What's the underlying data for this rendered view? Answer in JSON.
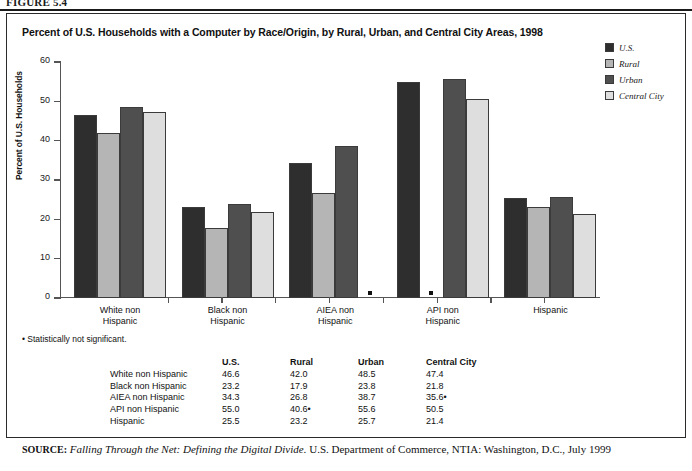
{
  "figure": {
    "label": "FIGURE 5.4"
  },
  "chart_data": {
    "type": "bar",
    "title": "Percent of U.S. Households with a Computer by Race/Origin, by Rural, Urban, and Central City Areas, 1998",
    "xlabel": "",
    "ylabel": "Percent of U.S. Households",
    "ylim": [
      0,
      60
    ],
    "yticks": [
      0,
      10,
      20,
      30,
      40,
      50,
      60
    ],
    "grid": false,
    "legend_position": "top-right",
    "categories": [
      "White non Hispanic",
      "Black non Hispanic",
      "AIEA non Hispanic",
      "API non Hispanic",
      "Hispanic"
    ],
    "series": [
      {
        "name": "U.S.",
        "color": "#2e2e2e",
        "values": [
          46.6,
          23.2,
          34.3,
          55.0,
          25.5
        ]
      },
      {
        "name": "Rural",
        "color": "#b5b5b5",
        "values": [
          42.0,
          17.9,
          26.8,
          40.6,
          23.2
        ]
      },
      {
        "name": "Urban",
        "color": "#4f4f4f",
        "values": [
          48.5,
          23.8,
          38.7,
          55.6,
          25.7
        ]
      },
      {
        "name": "Central City",
        "color": "#dedede",
        "values": [
          47.4,
          21.8,
          35.6,
          50.5,
          21.4
        ]
      }
    ],
    "not_significant": [
      {
        "category": "AIEA non Hispanic",
        "series": "Central City"
      },
      {
        "category": "API non Hispanic",
        "series": "Rural"
      }
    ],
    "annotations": [
      "• Statistically not significant."
    ]
  },
  "footnote": "• Statistically not significant.",
  "table": {
    "columns": [
      "",
      "U.S.",
      "Rural",
      "Urban",
      "Central City"
    ],
    "rows": [
      {
        "label": "White non Hispanic",
        "us": "46.6",
        "rural": "42.0",
        "urban": "48.5",
        "central": "47.4"
      },
      {
        "label": "Black non Hispanic",
        "us": "23.2",
        "rural": "17.9",
        "urban": "23.8",
        "central": "21.8"
      },
      {
        "label": "AIEA non Hispanic",
        "us": "34.3",
        "rural": "26.8",
        "urban": "38.7",
        "central": "35.6•"
      },
      {
        "label": "API non Hispanic",
        "us": "55.0",
        "rural": "40.6•",
        "urban": "55.6",
        "central": "50.5"
      },
      {
        "label": "Hispanic",
        "us": "25.5",
        "rural": "23.2",
        "urban": "25.7",
        "central": "21.4"
      }
    ]
  },
  "source": {
    "label": "SOURCE:",
    "italic_part": "Falling Through the Net: Defining the Digital Divide.",
    "rest": " U.S. Department of Commerce, NTIA: Washington, D.C., July 1999"
  }
}
